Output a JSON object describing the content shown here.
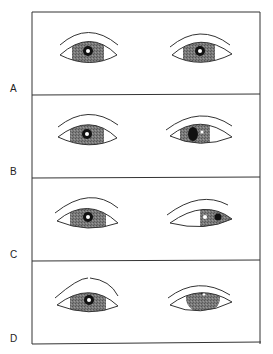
{
  "figure": {
    "type": "medical-illustration",
    "colors": {
      "line": "#333333",
      "iris": "#6b6b6b",
      "pupil": "#111111",
      "background": "#ffffff"
    },
    "panels": [
      {
        "label": "A",
        "left_eye": "iris centered, normal pupil",
        "right_eye": "iris centered, normal pupil"
      },
      {
        "label": "B",
        "left_eye": "iris centered, normal pupil",
        "right_eye": "dilated pupil, slightly shifted"
      },
      {
        "label": "C",
        "left_eye": "iris centered, normal pupil",
        "right_eye": "iris deviated outward (lateral)"
      },
      {
        "label": "D",
        "left_eye": "iris centered, normal pupil",
        "right_eye": "iris deviated upward, lid droop"
      }
    ]
  }
}
